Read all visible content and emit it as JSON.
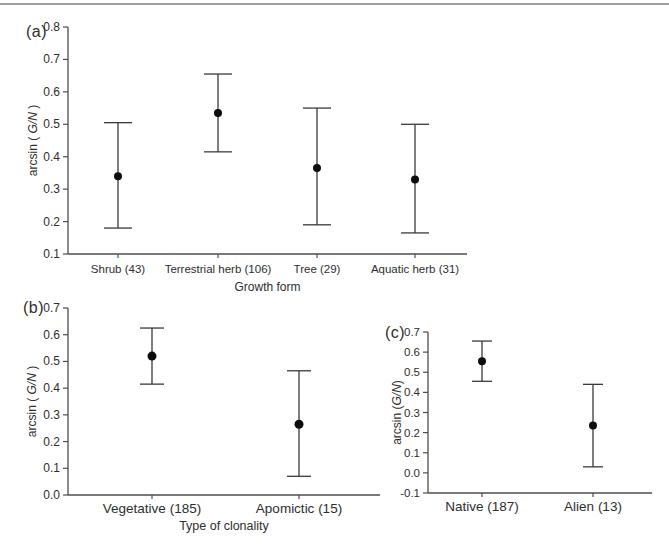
{
  "figure": {
    "background": "#ffffff",
    "divider_color": "#9e9e9e",
    "axis_color": "#4d4d4d",
    "point_color": "#0d0d0d",
    "errorbar_color": "#3a3a3a",
    "text_color": "#2e2e2e"
  },
  "chart_data": [
    {
      "panel_letter": "(a)",
      "type": "scatter",
      "title": "",
      "xlabel": "Growth form",
      "ylabel": {
        "prefix": "arcsin ( ",
        "italic": "G/N",
        "suffix": " )"
      },
      "categories": [
        "Shrub (43)",
        "Terrestrial herb (106)",
        "Tree (29)",
        "Aquatic herb (31)"
      ],
      "series": [
        {
          "name": "mean",
          "values": [
            0.34,
            0.535,
            0.365,
            0.33
          ]
        }
      ],
      "ci_low": [
        0.18,
        0.415,
        0.19,
        0.165
      ],
      "ci_high": [
        0.505,
        0.655,
        0.55,
        0.5
      ],
      "ylim": [
        0.1,
        0.8
      ],
      "ytick_step": 0.1,
      "yticks": [
        "0.1",
        "0.2",
        "0.3",
        "0.4",
        "0.5",
        "0.6",
        "0.7",
        "0.8"
      ],
      "grid": false,
      "legend": "none"
    },
    {
      "panel_letter": "(b)",
      "type": "scatter",
      "title": "",
      "xlabel": "Type of clonality",
      "ylabel": {
        "prefix": "arcsin ( ",
        "italic": "G/N",
        "suffix": " )"
      },
      "categories": [
        "Vegetative (185)",
        "Apomictic (15)"
      ],
      "series": [
        {
          "name": "mean",
          "values": [
            0.52,
            0.265
          ]
        }
      ],
      "ci_low": [
        0.415,
        0.07
      ],
      "ci_high": [
        0.625,
        0.465
      ],
      "ylim": [
        0.0,
        0.7
      ],
      "ytick_step": 0.1,
      "yticks": [
        "0.0",
        "0.1",
        "0.2",
        "0.3",
        "0.4",
        "0.5",
        "0.6",
        "0.7"
      ],
      "grid": false,
      "legend": "none"
    },
    {
      "panel_letter": "(c)",
      "type": "scatter",
      "title": "",
      "xlabel": "",
      "ylabel": {
        "prefix": "arcsin (",
        "italic": "G/N",
        "suffix": ")"
      },
      "categories": [
        "Native (187)",
        "Alien (13)"
      ],
      "series": [
        {
          "name": "mean",
          "values": [
            0.555,
            0.235
          ]
        }
      ],
      "ci_low": [
        0.455,
        0.03
      ],
      "ci_high": [
        0.655,
        0.44
      ],
      "ylim": [
        -0.1,
        0.7
      ],
      "ytick_step": 0.1,
      "yticks": [
        "-0.1",
        "0.0",
        "0.1",
        "0.2",
        "0.3",
        "0.4",
        "0.5",
        "0.6",
        "0.7"
      ],
      "grid": false,
      "legend": "none"
    }
  ]
}
